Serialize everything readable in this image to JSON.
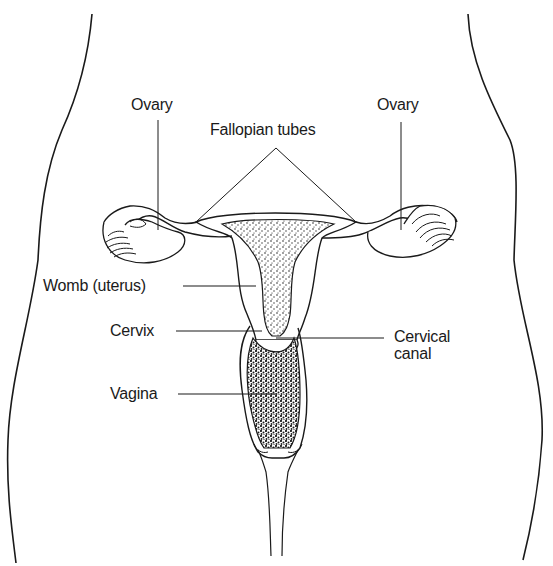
{
  "diagram": {
    "colors": {
      "line": "#1a1a1a",
      "background": "#ffffff",
      "stipple": "#2a2a2a"
    },
    "labels": {
      "ovary_left": "Ovary",
      "ovary_right": "Ovary",
      "fallopian_tubes": "Fallopian tubes",
      "womb": "Womb (uterus)",
      "cervix": "Cervix",
      "cervical_canal": "Cervical\ncanal",
      "vagina": "Vagina"
    }
  }
}
